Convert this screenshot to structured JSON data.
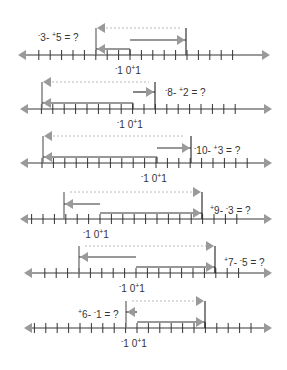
{
  "colors": {
    "axis": "#7a7a7a",
    "arrowhead": "#9a9a9a",
    "bar": "#333333",
    "dotted": "#b8b8b8",
    "text": "#333333"
  },
  "tick_spacing": 11.4,
  "problems": [
    {
      "id": 1,
      "question": "‾3 - ⁺5 = ?",
      "sign_a": "-",
      "a": "3",
      "sign_b": "+",
      "b": "5",
      "axis_y": 55,
      "zero_x": 130,
      "x_left": 18,
      "x_right": 270,
      "ticks_from": -8,
      "ticks_to": 9,
      "left_bar_x": 96,
      "right_bar_x": 186,
      "box_from_x": 96,
      "box_to_x": 130,
      "inner_arrow": {
        "from_x": 130,
        "to_x": 186,
        "y": 40,
        "dir": "right"
      },
      "label": {
        "x": 38,
        "y": 33
      },
      "zero_labels": {
        "x": 115,
        "y": 64
      }
    },
    {
      "id": 2,
      "question": "‾8 - ⁺2 = ?",
      "sign_a": "-",
      "a": "8",
      "sign_b": "+",
      "b": "2",
      "axis_y": 109,
      "zero_x": 144,
      "x_left": 20,
      "x_right": 272,
      "ticks_from": -9,
      "ticks_to": 8,
      "left_bar_x": 42,
      "right_bar_x": 155,
      "box_from_x": 42,
      "box_to_x": 133,
      "inner_arrow": {
        "from_x": 133,
        "to_x": 155,
        "y": 92,
        "dir": "right"
      },
      "label": {
        "x": 165,
        "y": 88
      },
      "zero_labels": {
        "x": 117,
        "y": 118
      }
    },
    {
      "id": 3,
      "question": "‾10 - ⁺3 = ?",
      "sign_a": "-",
      "a": "10",
      "sign_b": "+",
      "b": "3",
      "axis_y": 163,
      "zero_x": 156,
      "x_left": 20,
      "x_right": 272,
      "ticks_from": -10,
      "ticks_to": 8,
      "left_bar_x": 43,
      "right_bar_x": 191,
      "box_from_x": 43,
      "box_to_x": 157,
      "inner_arrow": {
        "from_x": 157,
        "to_x": 191,
        "y": 148,
        "dir": "right"
      },
      "label": {
        "x": 194,
        "y": 146
      },
      "zero_labels": {
        "x": 141,
        "y": 172
      }
    },
    {
      "id": 4,
      "question": "⁺9 - ‾3 = ?",
      "sign_a": "+",
      "a": "9",
      "sign_b": "-",
      "b": "3",
      "axis_y": 219,
      "zero_x": 100,
      "x_left": 20,
      "x_right": 272,
      "ticks_from": -6,
      "ticks_to": 12,
      "left_bar_x": 64,
      "right_bar_x": 202,
      "box_from_x": 100,
      "box_to_x": 202,
      "inner_arrow": {
        "from_x": 100,
        "to_x": 64,
        "y": 204,
        "dir": "left"
      },
      "label": {
        "x": 210,
        "y": 206
      },
      "zero_labels": {
        "x": 83,
        "y": 228
      }
    },
    {
      "id": 5,
      "question": "⁺7 - ‾5 = ?",
      "sign_a": "+",
      "a": "7",
      "sign_b": "-",
      "b": "5",
      "axis_y": 273,
      "zero_x": 136,
      "x_left": 24,
      "x_right": 272,
      "ticks_from": -10,
      "ticks_to": 9,
      "left_bar_x": 79,
      "right_bar_x": 215,
      "box_from_x": 136,
      "box_to_x": 215,
      "inner_arrow": {
        "from_x": 136,
        "to_x": 79,
        "y": 257,
        "dir": "left"
      },
      "label": {
        "x": 224,
        "y": 258
      },
      "zero_labels": {
        "x": 119,
        "y": 282
      }
    },
    {
      "id": 6,
      "question": "⁺6 - ‾1 = ?",
      "sign_a": "+",
      "a": "6",
      "sign_b": "-",
      "b": "1",
      "axis_y": 328,
      "zero_x": 137,
      "x_left": 24,
      "x_right": 272,
      "ticks_from": -9,
      "ticks_to": 10,
      "left_bar_x": 126,
      "right_bar_x": 205,
      "box_from_x": 137,
      "box_to_x": 205,
      "inner_arrow": {
        "from_x": 137,
        "to_x": 126,
        "y": 312,
        "dir": "left"
      },
      "label": {
        "x": 78,
        "y": 310
      },
      "zero_labels": {
        "x": 121,
        "y": 337
      }
    }
  ],
  "axis_labels": {
    "neg_one": "1",
    "zero": "0",
    "pos_one": "1",
    "neg_sign": "-",
    "pos_sign": "+"
  }
}
